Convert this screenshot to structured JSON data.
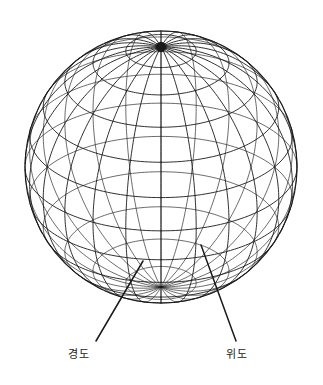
{
  "figure": {
    "background_color": "#ffffff",
    "line_color": "#1a1a1a",
    "line_width": 0.9,
    "sphere": {
      "center_x": 161,
      "center_y": 167,
      "radius": 136,
      "view_tilt_degrees": 62,
      "pole_x": 163,
      "pole_y": 66,
      "meridian_count": 24,
      "meridian_step_degrees": 15,
      "parallel_count": 12,
      "parallel_step_degrees": 15,
      "parallel_latitudes": [
        75,
        60,
        45,
        30,
        15,
        0,
        -15,
        -30,
        -45,
        -60,
        -75
      ],
      "outline": true
    }
  },
  "annotations": {
    "longitude": {
      "label": "경도",
      "label_x": 82,
      "label_y": 352,
      "leader_from_x": 96,
      "leader_from_y": 341,
      "leader_to_x": 143,
      "leader_to_y": 261
    },
    "latitude": {
      "label": "위도",
      "label_x": 240,
      "label_y": 352,
      "leader_from_x": 236,
      "leader_from_y": 341,
      "leader_to_x": 201,
      "leader_to_y": 245
    }
  }
}
